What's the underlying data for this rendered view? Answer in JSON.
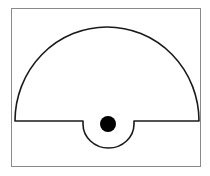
{
  "diagram": {
    "title": "",
    "frame": {
      "x": 11,
      "y": 8,
      "width": 190,
      "height": 159,
      "stroke": "#8a8a8a"
    },
    "shape": {
      "description": "semicircle with semicircular notch below baseline",
      "stroke": "#1a1a1a",
      "fill": "#ffffff"
    },
    "dot": {
      "cx": 108,
      "cy": 124,
      "r": 8,
      "fill": "#000000"
    }
  }
}
